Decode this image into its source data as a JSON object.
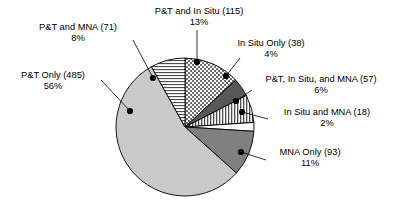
{
  "chart_data": {
    "type": "pie",
    "title": "",
    "subtitle": "",
    "xlabel": "",
    "ylabel": "",
    "legend_position": "none",
    "grid": false,
    "total": 877,
    "units": "sites",
    "categories": [
      "P&T and In Situ",
      "In Situ Only",
      "P&T, In Situ, and MNA",
      "In Situ and MNA",
      "MNA Only",
      "P&T Only",
      "P&T and MNA"
    ],
    "values": [
      115,
      38,
      57,
      18,
      93,
      485,
      71
    ],
    "percentages": [
      13,
      4,
      6,
      2,
      11,
      56,
      8
    ],
    "slices": [
      {
        "name": "P&T and In Situ",
        "value": 115,
        "percent": 13,
        "value_text": "(115)",
        "percent_text": "13%",
        "label_line1": "P&T and In Situ (115)",
        "label_line2": "13%",
        "fill": "checkerboard",
        "color": "#9a9a9a",
        "start_deg": 0,
        "end_deg": 47.2
      },
      {
        "name": "In Situ Only",
        "value": 38,
        "percent": 4,
        "value_text": "(38)",
        "percent_text": "4%",
        "label_line1": "In Situ Only (38)",
        "label_line2": "4%",
        "fill": "solid-dark-gray",
        "color": "#575757",
        "start_deg": 47.2,
        "end_deg": 62.8
      },
      {
        "name": "P&T, In Situ, and MNA",
        "value": 57,
        "percent": 6,
        "value_text": "(57)",
        "percent_text": "6%",
        "label_line1": "P&T, In Situ, and MNA (57)",
        "label_line2": "6%",
        "fill": "vertical-lines",
        "color": "#ffffff",
        "start_deg": 62.8,
        "end_deg": 86.2
      },
      {
        "name": "In Situ and MNA",
        "value": 18,
        "percent": 2,
        "value_text": "(18)",
        "percent_text": "2%",
        "label_line1": "In Situ and MNA (18)",
        "label_line2": "2%",
        "fill": "white",
        "color": "#ffffff",
        "start_deg": 86.2,
        "end_deg": 93.6
      },
      {
        "name": "MNA Only",
        "value": 93,
        "percent": 11,
        "value_text": "(93)",
        "percent_text": "11%",
        "label_line1": "MNA Only (93)",
        "label_line2": "11%",
        "fill": "solid-medium-gray",
        "color": "#808080",
        "start_deg": 93.6,
        "end_deg": 131.8
      },
      {
        "name": "P&T Only",
        "value": 485,
        "percent": 56,
        "value_text": "(485)",
        "percent_text": "56%",
        "label_line1": "P&T Only (485)",
        "label_line2": "56%",
        "fill": "solid-light-gray",
        "color": "#c8c8c8",
        "start_deg": 131.8,
        "end_deg": 330.9
      },
      {
        "name": "P&T and MNA",
        "value": 71,
        "percent": 8,
        "value_text": "(71)",
        "percent_text": "8%",
        "label_line1": "P&T and MNA (71)",
        "label_line2": "8%",
        "fill": "horizontal-lines",
        "color": "#ffffff",
        "start_deg": 330.9,
        "end_deg": 360
      }
    ]
  },
  "colors": {
    "outline": "#000000",
    "marker": "#000000",
    "leader": "#000000",
    "background": "#ffffff",
    "text": "#000000"
  }
}
